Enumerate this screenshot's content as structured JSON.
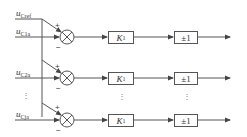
{
  "inputs": {
    "reference": {
      "symbol": "u",
      "subscript": "Cref"
    },
    "rows": [
      {
        "symbol": "u",
        "subscript": "C1a"
      },
      {
        "symbol": "u",
        "subscript": "C2a"
      },
      {
        "symbol": "u",
        "subscript": "Cja"
      }
    ]
  },
  "summing_junction": {
    "plus_sign": "+",
    "minus_sign": "−"
  },
  "gain_block": {
    "symbol": "K",
    "subscript": "1"
  },
  "sign_block": {
    "label": "±1"
  },
  "ellipsis": "⋮",
  "colors": {
    "line": "#555555",
    "text": "#333333",
    "background": "#ffffff"
  }
}
